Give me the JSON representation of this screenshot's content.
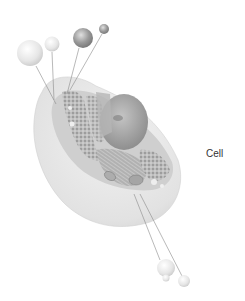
{
  "diagram": {
    "label": "Cell",
    "colors": {
      "background": "#ffffff",
      "label": "#333333",
      "leader_line": "#8a8a8a",
      "membrane": "#e4e4e4",
      "cytoplasm": "#c9c9c9",
      "nucleus": "#a8a8a8"
    },
    "callout_spheres": [
      {
        "id": "sphere-1",
        "style": "pale"
      },
      {
        "id": "sphere-2",
        "style": "pale"
      },
      {
        "id": "sphere-3",
        "style": "textured"
      },
      {
        "id": "sphere-4",
        "style": "textured"
      },
      {
        "id": "sphere-5",
        "style": "pale"
      },
      {
        "id": "sphere-6",
        "style": "pale"
      }
    ]
  }
}
